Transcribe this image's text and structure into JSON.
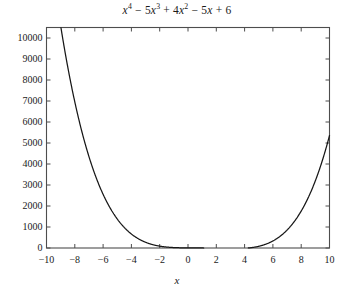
{
  "chart_data": {
    "type": "line",
    "title_parts": {
      "term1_var": "x",
      "term1_exp": "4",
      "op1": " − ",
      "term2_coef": "5",
      "term2_var": "x",
      "term2_exp": "3",
      "op2": " + ",
      "term3_coef": "4",
      "term3_var": "x",
      "term3_exp": "2",
      "op3": " − ",
      "term4_coef": "5",
      "term4_var": "x",
      "op4": " + ",
      "term5_const": "6"
    },
    "expression": "x^4 - 5x^3 + 4x^2 - 5x + 6",
    "xlabel": "x",
    "ylabel": "",
    "xlim": [
      -10,
      10
    ],
    "ylim": [
      0,
      10500
    ],
    "xticks": [
      -10,
      -8,
      -6,
      -4,
      -2,
      0,
      2,
      4,
      6,
      8,
      10
    ],
    "xtick_labels": [
      "−10",
      "−8",
      "−6",
      "−4",
      "−2",
      "0",
      "2",
      "4",
      "6",
      "8",
      "10"
    ],
    "yticks": [
      0,
      1000,
      2000,
      3000,
      4000,
      5000,
      6000,
      7000,
      8000,
      9000,
      10000
    ],
    "ytick_labels": [
      "0",
      "1000",
      "2000",
      "3000",
      "4000",
      "5000",
      "6000",
      "7000",
      "8000",
      "9000",
      "10000"
    ],
    "grid": false,
    "legend": false,
    "frame": true,
    "tick_direction": "in",
    "line_color": "#171717",
    "frame_color": "#4d4d4d",
    "background_color": "#ffffff",
    "coefficients": [
      1,
      -5,
      4,
      -5,
      6
    ],
    "x": [
      -10,
      -9.6,
      -9.2,
      -8.8,
      -8.4,
      -8,
      -7.6,
      -7.2,
      -6.8,
      -6.4,
      -6,
      -5.6,
      -5.2,
      -4.8,
      -4.4,
      -4,
      -3.6,
      -3.2,
      -2.8,
      -2.4,
      -2,
      -1.6,
      -1.2,
      -0.8,
      -0.4,
      0,
      0.4,
      0.8,
      1.2,
      1.6,
      2,
      2.4,
      2.8,
      3.2,
      3.6,
      4,
      4.4,
      4.8,
      5.2,
      5.6,
      6,
      6.4,
      6.8,
      7.2,
      7.6,
      8,
      8.4,
      8.8,
      9.2,
      9.6,
      10
    ],
    "y": [
      15456,
      13499,
      11742,
      10168,
      8762,
      7510,
      6398,
      5414,
      4546,
      3783,
      3114,
      2530,
      2022,
      1581,
      1200,
      872,
      590,
      349,
      144,
      -30,
      -176,
      -297,
      -396,
      -475,
      -535,
      6,
      -20,
      -42,
      -61,
      -76,
      -88,
      -96,
      -100,
      -98,
      -89,
      -70,
      -41,
      3,
      65,
      148,
      258,
      399,
      577,
      798,
      1069,
      1398,
      1793,
      2264,
      2821,
      3476,
      5456
    ],
    "curve_note": "Quartic polynomial, exits top of frame near x = -9.6; minimum region flat near y = 0 for x in [-1, 4]; rises to about 5456 at x = 10."
  },
  "figure": {
    "width": 354,
    "height": 301
  }
}
